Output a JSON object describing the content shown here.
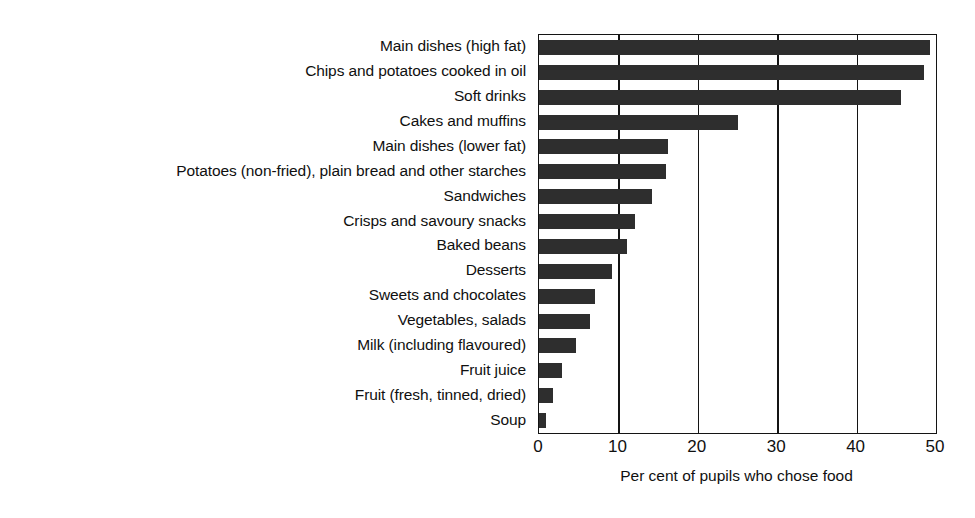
{
  "chart_data": {
    "type": "bar",
    "orientation": "horizontal",
    "title": "",
    "xlabel": "Per cent of pupils who chose food",
    "ylabel": "",
    "xlim": [
      0,
      50
    ],
    "xticks": [
      0,
      10,
      20,
      30,
      40,
      50
    ],
    "grid": true,
    "legend": false,
    "bar_color": "#2e2e2e",
    "axis_color": "#141414",
    "background_color": "#ffffff",
    "categories": [
      "Main dishes (high fat)",
      "Chips and potatoes cooked in oil",
      "Soft drinks",
      "Cakes and muffins",
      "Main dishes (lower fat)",
      "Potatoes (non-fried), plain bread and other starches",
      "Sandwiches",
      "Crisps and savoury snacks",
      "Baked beans",
      "Desserts",
      "Sweets and chocolates",
      "Vegetables, salads",
      "Milk (including flavoured)",
      "Fruit juice",
      "Fruit (fresh, tinned, dried)",
      "Soup"
    ],
    "values": [
      49.2,
      48.5,
      45.6,
      25.0,
      16.2,
      16.0,
      14.2,
      12.1,
      11.1,
      9.2,
      7.0,
      6.4,
      4.7,
      2.9,
      1.8,
      0.9
    ]
  }
}
